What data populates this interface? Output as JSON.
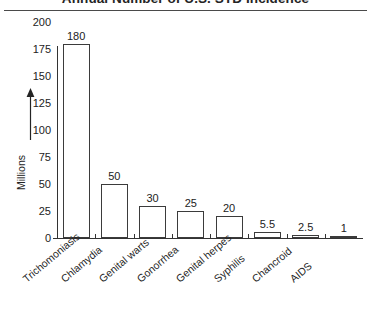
{
  "chart_data": {
    "type": "bar",
    "title": "Annual Number of U.S. STD Incidence",
    "xlabel": "",
    "ylabel": "Millions",
    "ylim": [
      0,
      200
    ],
    "yticks": [
      0,
      25,
      50,
      75,
      100,
      125,
      150,
      175,
      200
    ],
    "ytick_labels": [
      "0",
      "25",
      "50",
      "75",
      "100",
      "125",
      "150",
      "175",
      "200"
    ],
    "grid": false,
    "legend": "none",
    "categories": [
      "Trichomoniasis",
      "Chlamydia",
      "Genital warts",
      "Gonorrhea",
      "Genital herpes",
      "Syphilis",
      "Chancroid",
      "AIDS"
    ],
    "values": [
      180,
      50,
      30,
      25,
      20,
      5.5,
      2.5,
      1
    ],
    "value_labels": [
      "180",
      "50",
      "30",
      "25",
      "20",
      "5.5",
      "2.5",
      "1"
    ],
    "bar_fill": "#ffffff",
    "bar_edge": "#3b3b3b",
    "axis_color": "#333333",
    "text_color": "#242424",
    "background": "#ffffff"
  }
}
